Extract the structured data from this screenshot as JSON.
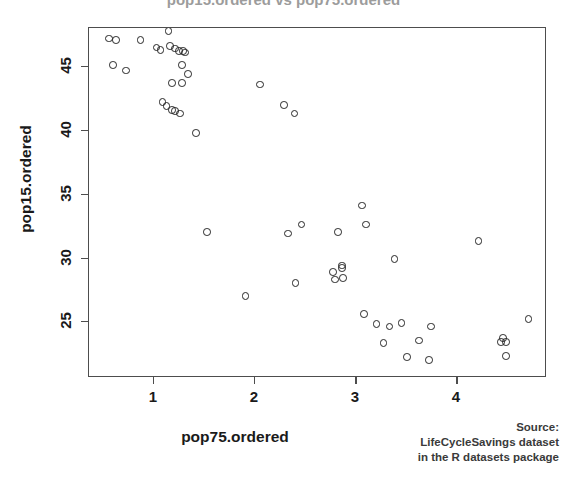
{
  "figure": {
    "title_clipped": "pop15.ordered vs pop75.ordered",
    "xlabel": "pop75.ordered",
    "ylabel": "pop15.ordered",
    "source": {
      "line1": "Source:",
      "line2": "LifeCycleSavings dataset",
      "line3": "in the R datasets package"
    }
  },
  "axes": {
    "x_ticks": [
      "1",
      "2",
      "3",
      "4"
    ],
    "y_ticks": [
      "25",
      "30",
      "35",
      "40",
      "45"
    ]
  },
  "chart_data": {
    "type": "scatter",
    "title": "pop15.ordered vs pop75.ordered",
    "xlabel": "pop75.ordered",
    "ylabel": "pop15.ordered",
    "xlim": [
      0.36,
      4.88
    ],
    "ylim": [
      21.1,
      48.9
    ],
    "xticks": [
      1,
      2,
      3,
      4
    ],
    "yticks": [
      25,
      30,
      35,
      40,
      45
    ],
    "grid": false,
    "legend": null,
    "marker": "open-circle",
    "n_points": 50,
    "series": [
      {
        "name": "countries",
        "x": [
          0.56,
          0.6,
          0.87,
          0.66,
          0.74,
          1.06,
          1.07,
          1.08,
          1.14,
          1.14,
          1.17,
          1.13,
          1.22,
          1.25,
          1.27,
          1.23,
          1.2,
          1.26,
          1.29,
          1.17,
          1.14,
          1.05,
          1.09,
          1.12,
          1.16,
          1.28,
          1.38,
          1.52,
          1.91,
          2.02,
          2.28,
          2.37,
          2.43,
          2.76,
          2.85,
          2.87,
          2.89,
          2.88,
          3.05,
          3.08,
          3.1,
          3.17,
          3.29,
          3.34,
          3.4,
          3.43,
          3.58,
          3.73,
          3.76,
          4.21,
          4.44,
          4.45,
          4.46,
          4.51,
          4.7
        ],
        "y": [
          47.2,
          47.1,
          47.2,
          45.1,
          44.7,
          46.4,
          46.2,
          46.3,
          47.8,
          46.6,
          46.3,
          46.1,
          46.3,
          46.2,
          46.2,
          45.0,
          43.6,
          44.3,
          44.1,
          43.6,
          42.1,
          41.9,
          41.7,
          41.5,
          41.3,
          41.3,
          39.8,
          32.0,
          27.0,
          43.6,
          42.0,
          41.3,
          32.0,
          32.6,
          28.0,
          29.5,
          29.2,
          28.2,
          34.1,
          31.8,
          32.6,
          25.6,
          24.5,
          29.9,
          23.3,
          25.0,
          23.2,
          24.5,
          22.0,
          31.3,
          24.0,
          23.6,
          23.4,
          22.3,
          25.2
        ]
      }
    ]
  },
  "point_pixels": [
    {
      "x": 0.56,
      "y": 47.2
    },
    {
      "x": 0.63,
      "y": 47.1
    },
    {
      "x": 0.87,
      "y": 47.1
    },
    {
      "x": 0.6,
      "y": 45.1
    },
    {
      "x": 0.73,
      "y": 44.7
    },
    {
      "x": 1.03,
      "y": 46.5
    },
    {
      "x": 1.07,
      "y": 46.3
    },
    {
      "x": 1.15,
      "y": 47.8
    },
    {
      "x": 1.16,
      "y": 46.6
    },
    {
      "x": 1.25,
      "y": 46.2
    },
    {
      "x": 1.29,
      "y": 46.2
    },
    {
      "x": 1.31,
      "y": 46.1
    },
    {
      "x": 1.21,
      "y": 46.4
    },
    {
      "x": 1.28,
      "y": 45.1
    },
    {
      "x": 1.34,
      "y": 44.4
    },
    {
      "x": 1.18,
      "y": 43.7
    },
    {
      "x": 1.28,
      "y": 43.7
    },
    {
      "x": 1.09,
      "y": 42.2
    },
    {
      "x": 1.13,
      "y": 41.9
    },
    {
      "x": 1.18,
      "y": 41.6
    },
    {
      "x": 1.21,
      "y": 41.5
    },
    {
      "x": 1.26,
      "y": 41.3
    },
    {
      "x": 1.42,
      "y": 39.8
    },
    {
      "x": 1.53,
      "y": 32.0
    },
    {
      "x": 1.91,
      "y": 27.0
    },
    {
      "x": 2.05,
      "y": 43.6
    },
    {
      "x": 2.29,
      "y": 42.0
    },
    {
      "x": 2.39,
      "y": 41.3
    },
    {
      "x": 2.33,
      "y": 31.9
    },
    {
      "x": 2.46,
      "y": 32.6
    },
    {
      "x": 2.4,
      "y": 28.0
    },
    {
      "x": 2.82,
      "y": 32.0
    },
    {
      "x": 2.86,
      "y": 29.4
    },
    {
      "x": 2.86,
      "y": 29.2
    },
    {
      "x": 2.77,
      "y": 28.9
    },
    {
      "x": 2.87,
      "y": 28.4
    },
    {
      "x": 2.79,
      "y": 28.3
    },
    {
      "x": 3.06,
      "y": 34.1
    },
    {
      "x": 3.1,
      "y": 32.6
    },
    {
      "x": 3.08,
      "y": 25.6
    },
    {
      "x": 3.2,
      "y": 24.8
    },
    {
      "x": 3.33,
      "y": 24.6
    },
    {
      "x": 3.27,
      "y": 23.3
    },
    {
      "x": 3.38,
      "y": 29.9
    },
    {
      "x": 3.45,
      "y": 24.9
    },
    {
      "x": 3.5,
      "y": 22.2
    },
    {
      "x": 3.62,
      "y": 23.5
    },
    {
      "x": 3.74,
      "y": 24.6
    },
    {
      "x": 3.72,
      "y": 22.0
    },
    {
      "x": 4.21,
      "y": 31.3
    },
    {
      "x": 4.45,
      "y": 23.7
    },
    {
      "x": 4.48,
      "y": 23.4
    },
    {
      "x": 4.43,
      "y": 23.4
    },
    {
      "x": 4.48,
      "y": 22.3
    },
    {
      "x": 4.7,
      "y": 25.2
    }
  ]
}
